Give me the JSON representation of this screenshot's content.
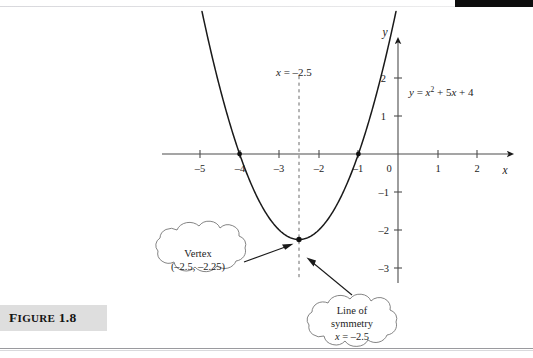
{
  "figure": {
    "caption_lead": "F",
    "caption_rest": "IGURE",
    "caption_number": "1.8",
    "caption_full": "FIGURE 1.8"
  },
  "plot": {
    "equation_label": "y = x² + 5x + 4",
    "axis_label_x": "x",
    "axis_label_y": "y",
    "symmetry_top_label": "x = –2.5",
    "x_ticks": [
      "–5",
      "–4",
      "–3",
      "–2",
      "–1",
      "0",
      "1",
      "2"
    ],
    "y_ticks": [
      "2",
      "1",
      "–1",
      "–2",
      "–3"
    ],
    "origin_label": "0"
  },
  "callouts": {
    "vertex": {
      "line1": "Vertex",
      "line2": "(–2.5, –2.25)"
    },
    "symmetry": {
      "line1": "Line of",
      "line2": "symmetry",
      "line3": "x = –2.5"
    }
  },
  "colors": {
    "page_background": "#ffffff",
    "curve": "#1a1a1a",
    "axis": "#4d4d4d",
    "dashed": "#6b6b6b",
    "caption_band": "#dedede",
    "top_band": "#0d0d0d"
  },
  "chart_data": {
    "type": "line",
    "title": "",
    "xlabel": "x",
    "ylabel": "y",
    "xlim": [
      -5.6,
      2.7
    ],
    "ylim": [
      -3.2,
      2.4
    ],
    "grid": false,
    "legend": "none",
    "function": "y = x^2 + 5x + 4",
    "series": [
      {
        "name": "y = x² + 5x + 4",
        "x": [
          -4.95,
          -4.75,
          -4.5,
          -4.25,
          -4.0,
          -3.75,
          -3.5,
          -3.25,
          -3.0,
          -2.75,
          -2.5,
          -2.25,
          -2.0,
          -1.75,
          -1.5,
          -1.25,
          -1.0,
          -0.75,
          -0.5,
          -0.25,
          -0.05
        ],
        "y": [
          3.7,
          2.69,
          1.75,
          0.81,
          0.0,
          -0.69,
          -1.25,
          -1.69,
          -2.0,
          -2.19,
          -2.25,
          -2.19,
          -2.0,
          -1.69,
          -1.25,
          -0.69,
          0.0,
          0.81,
          1.75,
          2.69,
          3.7
        ]
      }
    ],
    "annotations": [
      {
        "label": "Vertex (–2.5, –2.25)",
        "x": -2.5,
        "y": -2.25,
        "type": "point"
      },
      {
        "label": "Line of symmetry x = –2.5",
        "x": -2.5,
        "type": "vline"
      },
      {
        "label": "x-intercept",
        "x": -4.0,
        "y": 0,
        "type": "point"
      },
      {
        "label": "x-intercept",
        "x": -1.0,
        "y": 0,
        "type": "point"
      }
    ]
  }
}
